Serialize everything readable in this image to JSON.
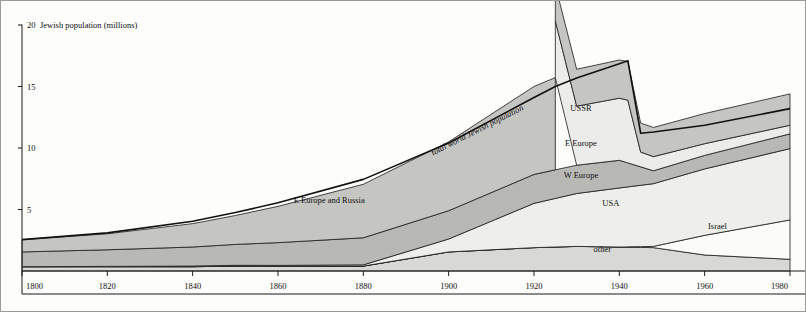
{
  "figure": {
    "title_axis": "Jewish population  (millions)",
    "top_curve_label": "total world Jewish population",
    "background": "#fdfdfc",
    "frame_color": "#9a9a96"
  },
  "axes": {
    "y_ticks": [
      "5",
      "10",
      "15",
      "20"
    ],
    "y_tick_values": [
      5,
      10,
      15,
      20
    ],
    "x_ticks": [
      "1800",
      "1820",
      "1840",
      "1860",
      "1880",
      "1900",
      "1920",
      "1940",
      "1960",
      "1980"
    ],
    "x_tick_values": [
      1800,
      1820,
      1840,
      1860,
      1880,
      1900,
      1920,
      1940,
      1960,
      1980
    ],
    "xlim": [
      1800,
      1980
    ],
    "ylim": [
      0,
      20
    ]
  },
  "band_labels": [
    {
      "name": "ussr-label",
      "text": "USSR",
      "x": 1931,
      "y": 13.0
    },
    {
      "name": "e-europe-label",
      "text": "E Europe",
      "x": 1931,
      "y": 10.2
    },
    {
      "name": "w-europe-label",
      "text": "W Europe",
      "x": 1931,
      "y": 7.55
    },
    {
      "name": "usa-label",
      "text": "USA",
      "x": 1938,
      "y": 5.3
    },
    {
      "name": "israel-label",
      "text": "Israel",
      "x": 1963,
      "y": 3.45
    },
    {
      "name": "other-label",
      "text": "other",
      "x": 1936,
      "y": 1.55
    },
    {
      "name": "e-europe-russia-label",
      "text": "E Europe and Russia",
      "x": 1872,
      "y": 5.5
    }
  ],
  "chart_data": {
    "type": "area",
    "title": "Jewish population  (millions)",
    "xlabel": "",
    "ylabel": "Jewish population (millions)",
    "xlim": [
      1800,
      1980
    ],
    "ylim": [
      0,
      20
    ],
    "grid": false,
    "legend": "inline band labels",
    "stacking": "stacked from baseline 0, order bottom->top: other, Israel, USA, W Europe, E Europe, USSR / E Europe and Russia",
    "annotations": [
      "total world Jewish population",
      "E Europe and Russia",
      "USSR",
      "E Europe",
      "W Europe",
      "USA",
      "Israel",
      "other"
    ],
    "series": [
      {
        "name": "other",
        "fill": "#d8d8d4",
        "x": [
          1800,
          1840,
          1850,
          1860,
          1880,
          1900,
          1920,
          1930,
          1940,
          1948,
          1960,
          1980
        ],
        "values": [
          0.35,
          0.35,
          0.4,
          0.38,
          0.4,
          1.55,
          1.9,
          2.0,
          1.95,
          1.9,
          1.3,
          0.95
        ]
      },
      {
        "name": "Israel",
        "fill": "#fbfbf9",
        "x": [
          1800,
          1880,
          1900,
          1920,
          1940,
          1948,
          1960,
          1980
        ],
        "values": [
          0.0,
          0.0,
          0.0,
          0.0,
          0.0,
          0.1,
          1.6,
          3.2
        ]
      },
      {
        "name": "USA",
        "fill": "#eeeeea",
        "x": [
          1800,
          1880,
          1900,
          1920,
          1930,
          1940,
          1948,
          1960,
          1980
        ],
        "values": [
          0.0,
          0.1,
          1.05,
          3.6,
          4.3,
          4.8,
          5.1,
          5.4,
          5.8
        ]
      },
      {
        "name": "W Europe",
        "fill": "#b8b8b4",
        "x": [
          1800,
          1820,
          1840,
          1860,
          1880,
          1900,
          1920,
          1930,
          1940,
          1948,
          1960,
          1980
        ],
        "values": [
          1.2,
          1.35,
          1.55,
          1.85,
          2.2,
          2.3,
          2.35,
          2.3,
          2.25,
          1.05,
          1.1,
          1.2
        ]
      },
      {
        "name": "E Europe",
        "fill": "#ececea",
        "x": [
          1925,
          1930,
          1940,
          1942,
          1945,
          1960,
          1980
        ],
        "values": [
          4.6,
          4.8,
          5.05,
          5.1,
          1.2,
          0.95,
          0.7
        ]
      },
      {
        "name": "USSR",
        "fill": "#c5c5c1",
        "x": [
          1925,
          1930,
          1940,
          1942,
          1945,
          1960,
          1980
        ],
        "values": [
          2.9,
          3.0,
          3.1,
          3.15,
          2.35,
          2.45,
          2.55
        ]
      },
      {
        "name": "E Europe and Russia",
        "fill": "#c5c5c1",
        "x": [
          1800,
          1820,
          1840,
          1850,
          1860,
          1880,
          1900,
          1920,
          1925
        ],
        "values": [
          1.0,
          1.3,
          1.9,
          2.35,
          2.95,
          4.35,
          5.6,
          7.15,
          7.5
        ]
      }
    ],
    "total_world_jewish_population": {
      "x": [
        1800,
        1820,
        1840,
        1850,
        1860,
        1880,
        1900,
        1920,
        1925,
        1930,
        1940,
        1942,
        1945,
        1948,
        1960,
        1980
      ],
      "values": [
        2.55,
        3.1,
        4.05,
        4.75,
        5.55,
        7.45,
        10.4,
        14.1,
        15.0,
        15.7,
        16.85,
        17.1,
        11.2,
        11.3,
        11.85,
        13.2
      ]
    }
  }
}
